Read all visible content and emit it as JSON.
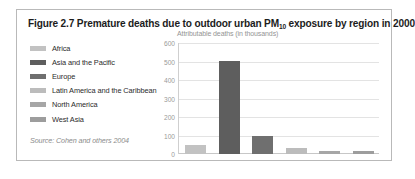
{
  "figure": {
    "title_pre": "Figure 2.7 Premature deaths due to outdoor urban PM",
    "title_sub": "10",
    "title_post": " exposure by region in 2000",
    "source": "Source: Cohen and others 2004"
  },
  "legend": {
    "items": [
      {
        "label": "Africa",
        "color": "#c2c2c2"
      },
      {
        "label": "Asia and the Pacific",
        "color": "#5e5e5e"
      },
      {
        "label": "Europe",
        "color": "#6f6f6f"
      },
      {
        "label": "Latin America and the Caribbean",
        "color": "#bcbcbc"
      },
      {
        "label": "North America",
        "color": "#a6a6a6"
      },
      {
        "label": "West Asia",
        "color": "#9d9d9d"
      }
    ]
  },
  "chart_data": {
    "type": "bar",
    "title": "Figure 2.7 Premature deaths due to outdoor urban PM10 exposure by region in 2000",
    "xlabel": "",
    "ylabel": "Attributable deaths (in thousands)",
    "ylim": [
      0,
      600
    ],
    "yticks": [
      0,
      100,
      200,
      300,
      400,
      500,
      600
    ],
    "ytick_labels": [
      "0",
      "100",
      "200",
      "300",
      "400",
      "500",
      "600"
    ],
    "grid": true,
    "legend_position": "left",
    "categories": [
      "Africa",
      "Asia and the Pacific",
      "Europe",
      "Latin America and the Caribbean",
      "North America",
      "West Asia"
    ],
    "values": [
      48,
      505,
      95,
      35,
      16,
      15
    ],
    "colors": [
      "#c2c2c2",
      "#5e5e5e",
      "#6f6f6f",
      "#bcbcbc",
      "#a6a6a6",
      "#9d9d9d"
    ]
  }
}
